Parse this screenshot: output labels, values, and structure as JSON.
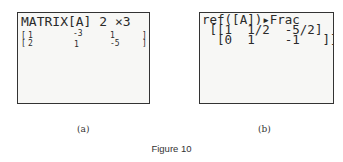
{
  "panel_a": {
    "title": "MATRIX[A] 2 ×3",
    "rows": [
      {
        "open": "[",
        "c1": "1",
        "c2": "-3",
        "c3": "1",
        "close": "]"
      },
      {
        "open": "[",
        "c1": "2",
        "c2": "1",
        "c3": "-5",
        "close": "]"
      }
    ],
    "caption": "(a)"
  },
  "panel_b": {
    "command": "ref([A])▸Frac",
    "row1": " [[1  1/2  -5/2]",
    "row2": "  [0  1    -1   ]]",
    "caption": "(b)"
  },
  "figure_caption": "Figure 10"
}
